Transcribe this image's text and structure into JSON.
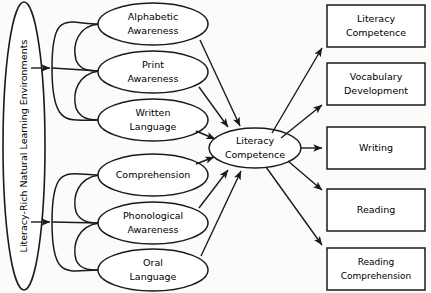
{
  "diagram": {
    "source_node": {
      "label": "Literacy-Rich Natural Learning Environments",
      "shape": "ellipse",
      "orientation": "vertical"
    },
    "upper_group": {
      "name": "upper-cluster",
      "nodes": [
        {
          "id": "alphabetic-awareness",
          "line1": "Alphabetic",
          "line2": "Awareness"
        },
        {
          "id": "print-awareness",
          "line1": "Print",
          "line2": "Awareness"
        },
        {
          "id": "written-language",
          "line1": "Written",
          "line2": "Language"
        }
      ]
    },
    "lower_group": {
      "name": "lower-cluster",
      "nodes": [
        {
          "id": "comprehension",
          "line1": "Comprehension",
          "line2": ""
        },
        {
          "id": "phonological-awareness",
          "line1": "Phonological",
          "line2": "Awareness"
        },
        {
          "id": "oral-language",
          "line1": "Oral",
          "line2": "Language"
        }
      ]
    },
    "hub_node": {
      "id": "literacy-competence-hub",
      "line1": "Literacy",
      "line2": "Competence",
      "shape": "ellipse"
    },
    "outcomes": [
      {
        "id": "outcome-literacy-competence",
        "line1": "Literacy",
        "line2": "Competence"
      },
      {
        "id": "outcome-vocabulary-development",
        "line1": "Vocabulary",
        "line2": "Development"
      },
      {
        "id": "outcome-writing",
        "line1": "Writing",
        "line2": ""
      },
      {
        "id": "outcome-reading",
        "line1": "Reading",
        "line2": ""
      },
      {
        "id": "outcome-reading-comprehension",
        "line1": "Reading",
        "line2": "Comprehension"
      }
    ],
    "colors": {
      "background": "#fbfbfa",
      "stroke": "#1a1a1a",
      "node_fill": "#ffffff",
      "text": "#000000"
    }
  }
}
